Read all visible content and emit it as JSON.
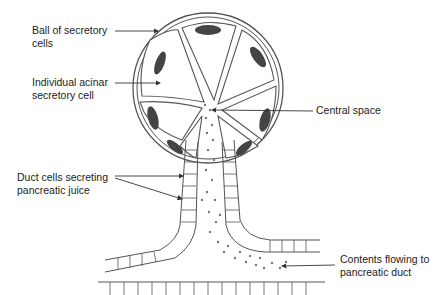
{
  "diagram": {
    "colors": {
      "background": "#ffffff",
      "outline": "#555555",
      "nucleus": "#444444",
      "text": "#222222",
      "arrow": "#333333"
    },
    "labels": {
      "ball": {
        "line1": "Ball of secretory",
        "line2": "cells"
      },
      "acinar": {
        "line1": "Individual acinar",
        "line2": "secretory cell"
      },
      "central": {
        "line1": "Central space"
      },
      "duct": {
        "line1": "Duct cells secreting",
        "line2": "pancreatic juice"
      },
      "contents": {
        "line1": "Contents flowing to",
        "line2": "pancreatic duct"
      }
    }
  }
}
